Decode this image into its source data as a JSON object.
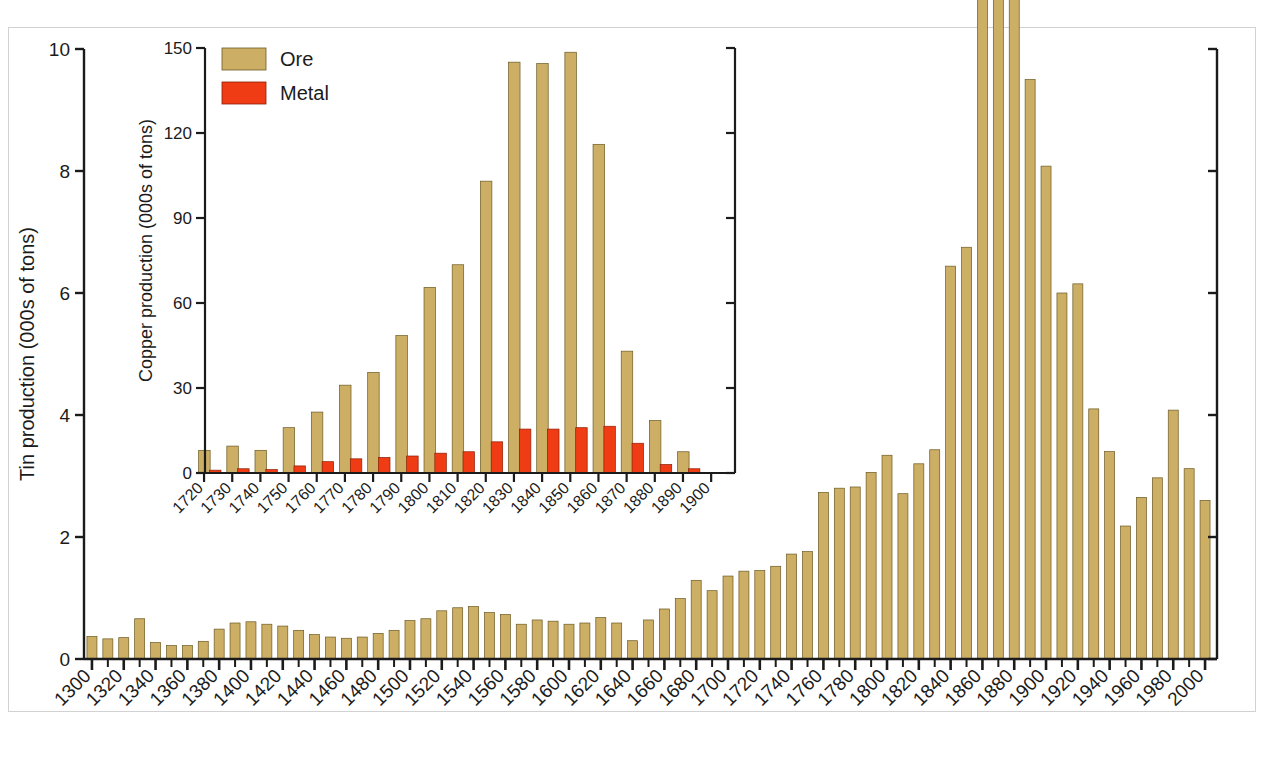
{
  "figure": {
    "background_color": "#ffffff",
    "border_color": "#d2d2d2"
  },
  "colors": {
    "ore": "#ccae64",
    "ore_edge": "#6b5a23",
    "metal": "#f03c14",
    "metal_edge": "#8a1f06",
    "axis": "#1b1b1b",
    "text": "#1b1b1b"
  },
  "legend": {
    "position": "inset-top-left",
    "items": [
      {
        "label": "Ore",
        "color_key": "ore"
      },
      {
        "label": "Metal",
        "color_key": "metal"
      }
    ]
  },
  "chart_data": [
    {
      "id": "main",
      "type": "bar",
      "title": "",
      "xlabel": "",
      "ylabel": "Tin production (000s of tons)",
      "ylim": [
        0,
        10
      ],
      "yticks": [
        0,
        2,
        4,
        6,
        8,
        10
      ],
      "ytick_labels": [
        "0",
        "2",
        "4",
        "6",
        "8",
        "10"
      ],
      "xlim": [
        1295,
        2005
      ],
      "xticks": [
        1300,
        1320,
        1340,
        1360,
        1380,
        1400,
        1420,
        1440,
        1460,
        1480,
        1500,
        1520,
        1540,
        1560,
        1580,
        1600,
        1620,
        1640,
        1660,
        1680,
        1700,
        1720,
        1740,
        1760,
        1780,
        1800,
        1820,
        1840,
        1860,
        1880,
        1900,
        1920,
        1940,
        1960,
        1980,
        2000
      ],
      "xtick_labels": [
        "1300",
        "1320",
        "1340",
        "1360",
        "1380",
        "1400",
        "1420",
        "1440",
        "1460",
        "1480",
        "1500",
        "1520",
        "1540",
        "1560",
        "1580",
        "1600",
        "1620",
        "1640",
        "1660",
        "1680",
        "1700",
        "1720",
        "1740",
        "1760",
        "1780",
        "1800",
        "1820",
        "1840",
        "1860",
        "1880",
        "1900",
        "1920",
        "1940",
        "1960",
        "1980",
        "2000"
      ],
      "grid": false,
      "series": [
        {
          "name": "Ore",
          "color_key": "ore",
          "x": [
            1300,
            1310,
            1320,
            1330,
            1340,
            1350,
            1360,
            1370,
            1380,
            1390,
            1400,
            1410,
            1420,
            1430,
            1440,
            1450,
            1460,
            1470,
            1480,
            1490,
            1500,
            1510,
            1520,
            1530,
            1540,
            1550,
            1560,
            1570,
            1580,
            1590,
            1600,
            1610,
            1620,
            1630,
            1640,
            1650,
            1660,
            1670,
            1680,
            1690,
            1700,
            1710,
            1720,
            1730,
            1740,
            1750,
            1760,
            1770,
            1780,
            1790,
            1800,
            1810,
            1820,
            1830,
            1840,
            1850,
            1860,
            1870,
            1880,
            1890,
            1900,
            1910,
            1920,
            1930,
            1940,
            1950,
            1960,
            1970,
            1980,
            1990,
            2000
          ],
          "values": [
            0.37,
            0.33,
            0.35,
            0.66,
            0.27,
            0.22,
            0.22,
            0.29,
            0.49,
            0.59,
            0.61,
            0.57,
            0.54,
            0.47,
            0.4,
            0.36,
            0.34,
            0.36,
            0.42,
            0.47,
            0.63,
            0.66,
            0.79,
            0.84,
            0.86,
            0.76,
            0.73,
            0.57,
            0.64,
            0.62,
            0.57,
            0.59,
            0.68,
            0.59,
            0.3,
            0.64,
            0.82,
            0.99,
            1.29,
            1.12,
            1.36,
            1.44,
            1.45,
            1.52,
            1.72,
            1.76,
            2.73,
            2.8,
            2.82,
            3.06,
            3.34,
            2.71,
            3.2,
            3.43,
            6.44,
            6.75,
            13.73,
            14.23,
            13.2,
            9.5,
            8.08,
            6.0,
            6.15,
            4.1,
            3.4,
            2.18,
            2.65,
            2.97,
            4.08,
            3.12,
            2.6
          ]
        }
      ]
    },
    {
      "id": "inset",
      "type": "bar",
      "title": "",
      "xlabel": "",
      "ylabel": "Copper production (000s of tons)",
      "ylim": [
        0,
        150
      ],
      "yticks": [
        0,
        30,
        60,
        90,
        120,
        150
      ],
      "ytick_labels": [
        "0",
        "30",
        "60",
        "90",
        "120",
        "150"
      ],
      "xlim": [
        1715,
        1905
      ],
      "xticks": [
        1720,
        1730,
        1740,
        1750,
        1760,
        1770,
        1780,
        1790,
        1800,
        1810,
        1820,
        1830,
        1840,
        1850,
        1860,
        1870,
        1880,
        1890,
        1900
      ],
      "xtick_labels": [
        "1720",
        "1730",
        "1740",
        "1750",
        "1760",
        "1770",
        "1780",
        "1790",
        "1800",
        "1810",
        "1820",
        "1830",
        "1840",
        "1850",
        "1860",
        "1870",
        "1880",
        "1890",
        "1900"
      ],
      "grid": false,
      "categories": [
        1720,
        1730,
        1740,
        1750,
        1760,
        1770,
        1780,
        1790,
        1800,
        1810,
        1820,
        1830,
        1840,
        1850,
        1860,
        1870,
        1880,
        1890,
        1900
      ],
      "series": [
        {
          "name": "Ore",
          "color_key": "ore",
          "values": [
            8.0,
            9.5,
            8.0,
            16.0,
            21.5,
            31.0,
            35.5,
            48.5,
            65.5,
            73.5,
            103.0,
            145.0,
            144.5,
            148.5,
            116.0,
            43.0,
            18.5,
            7.5,
            0.0
          ]
        },
        {
          "name": "Metal",
          "color_key": "metal",
          "values": [
            1.0,
            1.5,
            1.2,
            2.5,
            4.0,
            5.0,
            5.5,
            6.0,
            7.0,
            7.5,
            11.0,
            15.5,
            15.5,
            16.0,
            16.5,
            10.5,
            3.0,
            1.5,
            0.0
          ]
        }
      ]
    }
  ]
}
